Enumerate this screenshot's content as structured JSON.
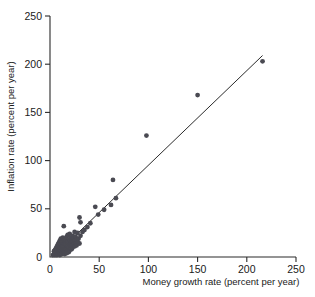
{
  "chart_data": {
    "type": "scatter",
    "title": "",
    "xlabel": "Money growth rate (percent per year)",
    "ylabel": "Inflation rate (percent per year)",
    "xlim": [
      0,
      250
    ],
    "ylim": [
      0,
      250
    ],
    "xticks": [
      0,
      50,
      100,
      150,
      200,
      250
    ],
    "yticks": [
      0,
      50,
      100,
      150,
      200,
      250
    ],
    "xticklabels": [
      "0",
      "50",
      "100",
      "150",
      "200",
      "250"
    ],
    "yticklabels": [
      "0",
      "50",
      "100",
      "150",
      "200",
      "250"
    ],
    "grid": false,
    "legend": null,
    "marker_color": "#4a4a52",
    "line_color": "#2b2b2b",
    "axis_color": "#2b2b2b",
    "fit_line": {
      "label": "",
      "x": [
        3,
        216
      ],
      "y": [
        0,
        209
      ]
    },
    "points": [
      [
        3,
        2
      ],
      [
        4,
        3
      ],
      [
        4,
        6
      ],
      [
        5,
        2
      ],
      [
        5,
        4
      ],
      [
        5,
        7
      ],
      [
        6,
        3
      ],
      [
        6,
        5
      ],
      [
        6,
        9
      ],
      [
        7,
        2
      ],
      [
        7,
        5
      ],
      [
        7,
        8
      ],
      [
        7,
        11
      ],
      [
        8,
        3
      ],
      [
        8,
        6
      ],
      [
        8,
        9
      ],
      [
        8,
        13
      ],
      [
        9,
        4
      ],
      [
        9,
        7
      ],
      [
        9,
        10
      ],
      [
        9,
        15
      ],
      [
        10,
        2
      ],
      [
        10,
        5
      ],
      [
        10,
        8
      ],
      [
        10,
        12
      ],
      [
        10,
        17
      ],
      [
        11,
        4
      ],
      [
        11,
        7
      ],
      [
        11,
        10
      ],
      [
        11,
        14
      ],
      [
        11,
        19
      ],
      [
        12,
        3
      ],
      [
        12,
        6
      ],
      [
        12,
        9
      ],
      [
        12,
        13
      ],
      [
        12,
        16
      ],
      [
        13,
        5
      ],
      [
        13,
        8
      ],
      [
        13,
        11
      ],
      [
        13,
        15
      ],
      [
        13,
        20
      ],
      [
        14,
        4
      ],
      [
        14,
        7
      ],
      [
        14,
        12
      ],
      [
        14,
        17
      ],
      [
        14,
        32
      ],
      [
        15,
        3
      ],
      [
        15,
        6
      ],
      [
        15,
        10
      ],
      [
        15,
        14
      ],
      [
        15,
        19
      ],
      [
        16,
        5
      ],
      [
        16,
        9
      ],
      [
        16,
        13
      ],
      [
        16,
        18
      ],
      [
        17,
        4
      ],
      [
        17,
        8
      ],
      [
        17,
        12
      ],
      [
        17,
        21
      ],
      [
        18,
        6
      ],
      [
        18,
        11
      ],
      [
        18,
        16
      ],
      [
        18,
        23
      ],
      [
        19,
        5
      ],
      [
        19,
        10
      ],
      [
        19,
        15
      ],
      [
        20,
        7
      ],
      [
        20,
        13
      ],
      [
        20,
        18
      ],
      [
        20,
        24
      ],
      [
        21,
        9
      ],
      [
        21,
        14
      ],
      [
        21,
        20
      ],
      [
        22,
        8
      ],
      [
        22,
        12
      ],
      [
        22,
        17
      ],
      [
        23,
        10
      ],
      [
        23,
        16
      ],
      [
        23,
        22
      ],
      [
        24,
        13
      ],
      [
        24,
        19
      ],
      [
        25,
        11
      ],
      [
        25,
        17
      ],
      [
        25,
        26
      ],
      [
        26,
        14
      ],
      [
        26,
        21
      ],
      [
        27,
        12
      ],
      [
        27,
        18
      ],
      [
        28,
        16
      ],
      [
        28,
        25
      ],
      [
        29,
        19
      ],
      [
        30,
        14
      ],
      [
        30,
        41
      ],
      [
        31,
        22
      ],
      [
        31,
        36
      ],
      [
        33,
        26
      ],
      [
        35,
        28
      ],
      [
        38,
        31
      ],
      [
        41,
        35
      ],
      [
        46,
        52
      ],
      [
        49,
        44
      ],
      [
        55,
        49
      ],
      [
        62,
        54
      ],
      [
        64,
        80
      ],
      [
        67,
        61
      ],
      [
        98,
        126
      ],
      [
        150,
        168
      ],
      [
        216,
        203
      ]
    ]
  }
}
